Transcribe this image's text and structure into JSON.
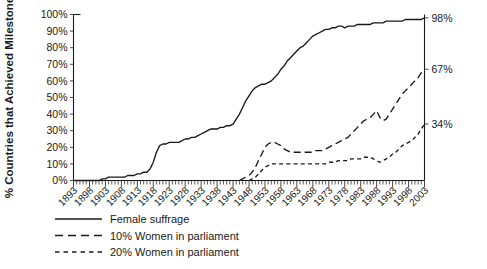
{
  "chart_data": {
    "type": "line",
    "title": "",
    "xlabel": "",
    "ylabel": "% Countries that Achieved Milestone",
    "xlim": [
      1893,
      2003
    ],
    "ylim": [
      0,
      100
    ],
    "grid": false,
    "legend_position": "bottom-left",
    "ytick_labels": [
      "0%",
      "10%",
      "20%",
      "30%",
      "40%",
      "50%",
      "60%",
      "70%",
      "80%",
      "90%",
      "100%"
    ],
    "ytick_values": [
      0,
      10,
      20,
      30,
      40,
      50,
      60,
      70,
      80,
      90,
      100
    ],
    "xtick_labels": [
      "1893",
      "1898",
      "1903",
      "1908",
      "1913",
      "1918",
      "1923",
      "1928",
      "1933",
      "1938",
      "1943",
      "1948",
      "1953",
      "1958",
      "1963",
      "1968",
      "1973",
      "1978",
      "1983",
      "1988",
      "1993",
      "1998",
      "2003"
    ],
    "xtick_values": [
      1893,
      1898,
      1903,
      1908,
      1913,
      1918,
      1923,
      1928,
      1933,
      1938,
      1943,
      1948,
      1953,
      1958,
      1963,
      1968,
      1973,
      1978,
      1983,
      1988,
      1993,
      1998,
      2003
    ],
    "minor_tick_interval": 1,
    "end_labels": [
      {
        "text": "98%",
        "value": 98,
        "series": "Female suffrage"
      },
      {
        "text": "67%",
        "value": 67,
        "series": "10% Women in parliament"
      },
      {
        "text": "34%",
        "value": 34,
        "series": "20% Women in parliament"
      }
    ],
    "series": [
      {
        "name": "Female suffrage",
        "style": "solid",
        "x": [
          1893,
          1894,
          1895,
          1896,
          1897,
          1898,
          1899,
          1900,
          1901,
          1902,
          1903,
          1904,
          1905,
          1906,
          1907,
          1908,
          1909,
          1910,
          1911,
          1912,
          1913,
          1914,
          1915,
          1916,
          1917,
          1918,
          1919,
          1920,
          1921,
          1922,
          1923,
          1924,
          1925,
          1926,
          1927,
          1928,
          1929,
          1930,
          1931,
          1932,
          1933,
          1934,
          1935,
          1936,
          1937,
          1938,
          1939,
          1940,
          1941,
          1942,
          1943,
          1944,
          1945,
          1946,
          1947,
          1948,
          1949,
          1950,
          1951,
          1952,
          1953,
          1954,
          1955,
          1956,
          1957,
          1958,
          1959,
          1960,
          1961,
          1962,
          1963,
          1964,
          1965,
          1966,
          1967,
          1968,
          1969,
          1970,
          1971,
          1972,
          1973,
          1974,
          1975,
          1976,
          1977,
          1978,
          1979,
          1980,
          1981,
          1982,
          1983,
          1984,
          1985,
          1986,
          1987,
          1988,
          1989,
          1990,
          1991,
          1992,
          1993,
          1994,
          1995,
          1996,
          1997,
          1998,
          1999,
          2000,
          2001,
          2002,
          2003
        ],
        "y": [
          0,
          0,
          0,
          0,
          0,
          0,
          0,
          0,
          0,
          1,
          1,
          2,
          2,
          2,
          2,
          2,
          2,
          3,
          3,
          3,
          4,
          4,
          5,
          5,
          7,
          11,
          17,
          21,
          22,
          22,
          23,
          23,
          23,
          23,
          24,
          25,
          25,
          26,
          26,
          27,
          28,
          29,
          30,
          31,
          31,
          31,
          32,
          32,
          33,
          33,
          34,
          37,
          40,
          44,
          48,
          51,
          54,
          56,
          57,
          58,
          58,
          59,
          60,
          62,
          64,
          67,
          69,
          72,
          74,
          76,
          78,
          80,
          81,
          83,
          85,
          87,
          88,
          89,
          90,
          91,
          91,
          92,
          92,
          93,
          93,
          92,
          93,
          93,
          93,
          94,
          94,
          94,
          94,
          94,
          95,
          95,
          95,
          95,
          96,
          96,
          96,
          96,
          96,
          96,
          97,
          97,
          97,
          97,
          97,
          97,
          98
        ]
      },
      {
        "name": "10% Women in parliament",
        "style": "long-dash",
        "x": [
          1945,
          1946,
          1947,
          1948,
          1949,
          1950,
          1951,
          1952,
          1953,
          1954,
          1955,
          1956,
          1957,
          1958,
          1959,
          1960,
          1961,
          1962,
          1963,
          1964,
          1965,
          1966,
          1967,
          1968,
          1969,
          1970,
          1971,
          1972,
          1973,
          1974,
          1975,
          1976,
          1977,
          1978,
          1979,
          1980,
          1981,
          1982,
          1983,
          1984,
          1985,
          1986,
          1987,
          1988,
          1989,
          1990,
          1991,
          1992,
          1993,
          1994,
          1995,
          1996,
          1997,
          1998,
          1999,
          2000,
          2001,
          2002,
          2003
        ],
        "y": [
          0,
          1,
          2,
          3,
          5,
          8,
          12,
          16,
          20,
          22,
          23,
          23,
          22,
          21,
          19,
          18,
          17,
          17,
          17,
          17,
          17,
          17,
          17,
          17,
          18,
          18,
          18,
          19,
          20,
          21,
          22,
          23,
          24,
          25,
          26,
          28,
          30,
          32,
          34,
          36,
          37,
          38,
          40,
          42,
          38,
          36,
          37,
          40,
          43,
          46,
          49,
          52,
          54,
          56,
          58,
          60,
          62,
          65,
          67
        ]
      },
      {
        "name": "20% Women in parliament",
        "style": "short-dash",
        "x": [
          1948,
          1949,
          1950,
          1951,
          1952,
          1953,
          1954,
          1955,
          1956,
          1957,
          1958,
          1959,
          1960,
          1961,
          1962,
          1963,
          1964,
          1965,
          1966,
          1967,
          1968,
          1969,
          1970,
          1971,
          1972,
          1973,
          1974,
          1975,
          1976,
          1977,
          1978,
          1979,
          1980,
          1981,
          1982,
          1983,
          1984,
          1985,
          1986,
          1987,
          1988,
          1989,
          1990,
          1991,
          1992,
          1993,
          1994,
          1995,
          1996,
          1997,
          1998,
          1999,
          2000,
          2001,
          2002,
          2003
        ],
        "y": [
          0,
          1,
          2,
          4,
          6,
          8,
          9,
          10,
          10,
          10,
          10,
          10,
          10,
          10,
          10,
          10,
          10,
          10,
          10,
          10,
          10,
          10,
          10,
          10,
          10,
          11,
          11,
          11,
          12,
          12,
          12,
          12,
          13,
          13,
          13,
          13,
          14,
          14,
          14,
          13,
          12,
          11,
          12,
          13,
          14,
          16,
          17,
          19,
          21,
          22,
          23,
          24,
          26,
          28,
          31,
          34
        ]
      }
    ]
  },
  "legend": {
    "items": [
      {
        "label": "Female suffrage",
        "style": "solid"
      },
      {
        "label": "10% Women in parliament",
        "style": "long-dash"
      },
      {
        "label": "20% Women in parliament",
        "style": "short-dash"
      }
    ]
  },
  "colors": {
    "line": "#1a1a1a",
    "background": "#ffffff",
    "axis": "#1a1a1a"
  }
}
